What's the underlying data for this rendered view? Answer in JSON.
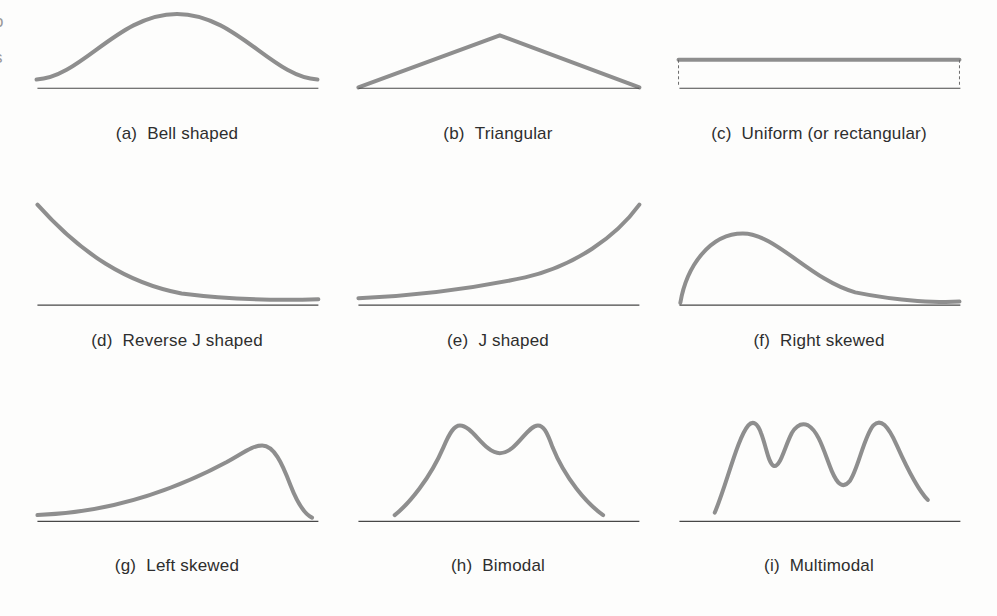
{
  "figure": {
    "curve_color": "#8e8e8e",
    "baseline_color": "#474747",
    "label_color": "#2e2e2e",
    "background": "#fdfdfc"
  },
  "page_edge": {
    "fragment_top": "o",
    "fragment_bottom": "s"
  },
  "panels": [
    {
      "tag": "(a)",
      "name": "Bell shaped",
      "shape": "bell",
      "path": "M 5 93 C 55 90 95 10 160 10 C 225 10 265 90 315 93"
    },
    {
      "tag": "(b)",
      "name": "Triangular",
      "shape": "triangle",
      "path": "M 6 103 L 162 37 L 316 103"
    },
    {
      "tag": "(c)",
      "name": "Uniform (or rectangular)",
      "shape": "uniform",
      "path": "M 5 68 L 315 68",
      "side_left": "M 5 68 L 5 102",
      "side_right": "M 315 68 L 315 102"
    },
    {
      "tag": "(d)",
      "name": "Reverse J shaped",
      "shape": "reverse-j",
      "path": "M 6 17 C 55 60 105 85 165 94 C 215 99 275 100 316 99"
    },
    {
      "tag": "(e)",
      "name": "J shaped",
      "shape": "j",
      "path": "M 6 98 C 70 96 130 90 190 80 C 245 70 290 45 316 17"
    },
    {
      "tag": "(f)",
      "name": "Right skewed",
      "shape": "right-skewed",
      "path": "M 7 102 C 14 70 40 42 76 42 C 112 42 150 82 200 93 C 250 101 295 102 315 101"
    },
    {
      "tag": "(g)",
      "name": "Left skewed",
      "shape": "left-skewed",
      "path": "M 6 99 C 85 97 155 80 215 57 C 237 48 244 44 254 44 C 267 44 276 58 285 75 C 292 88 300 98 309 101"
    },
    {
      "tag": "(h)",
      "name": "Bimodal",
      "shape": "bimodal",
      "path": "M 46 99 C 62 90 85 70 100 45 C 107 33 112 28 118 28 C 132 28 145 50 162 50 C 180 50 192 28 204 28 C 210 28 214 33 220 45 C 234 70 258 90 276 99"
    },
    {
      "tag": "(i)",
      "name": "Multimodal",
      "shape": "multimodal",
      "path": "M 45 97 C 58 75 70 38 82 28 C 87 24 92 26 96 34 C 102 45 104 58 110 60 C 117 62 122 45 130 34 C 136 27 142 26 148 28 C 160 33 166 50 174 64 C 180 74 186 79 194 72 C 203 63 210 36 220 28 C 228 22 236 28 246 44 C 256 60 268 78 280 87"
    }
  ]
}
